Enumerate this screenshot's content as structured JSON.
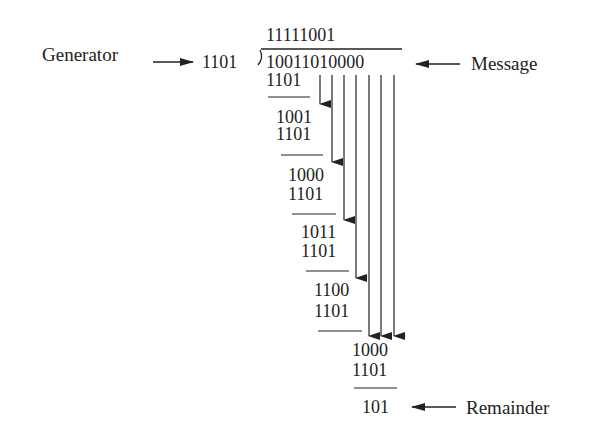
{
  "diagram": {
    "type": "crc-binary-long-division",
    "labels": {
      "generator": "Generator",
      "message": "Message",
      "remainder": "Remainder"
    },
    "divisor": "1101",
    "dividend": "10011010000",
    "quotient": "11111001",
    "steps": [
      {
        "value": "1101",
        "x": 266,
        "y": 71
      },
      {
        "value": "1001",
        "x": 276,
        "y": 108
      },
      {
        "value": "1101",
        "x": 276,
        "y": 125
      },
      {
        "value": "1000",
        "x": 288,
        "y": 166
      },
      {
        "value": "1101",
        "x": 288,
        "y": 185
      },
      {
        "value": "1011",
        "x": 301,
        "y": 223
      },
      {
        "value": "1101",
        "x": 301,
        "y": 242
      },
      {
        "value": "1100",
        "x": 314,
        "y": 281
      },
      {
        "value": "1101",
        "x": 314,
        "y": 302
      },
      {
        "value": "1000",
        "x": 352,
        "y": 341
      },
      {
        "value": "1101",
        "x": 352,
        "y": 361
      }
    ],
    "remainder_value": "101",
    "colors": {
      "ink": "#222222",
      "background": "#ffffff"
    }
  }
}
